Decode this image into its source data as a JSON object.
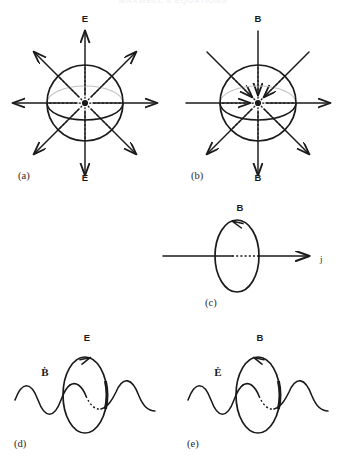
{
  "figure": {
    "title": "MAXWELL'S EQUATIONS",
    "background_color": "#ffffff",
    "ink_color": "#1a1a1a",
    "hidden_edge_color": "#b9b9bd",
    "width": 346,
    "height": 464
  },
  "panels": [
    {
      "id": "a",
      "label": "(a)",
      "label_x": 18,
      "label_y": 179,
      "kind": "sphere-radial-field",
      "center_x": 85,
      "center_y": 103,
      "radius": 38,
      "arrow_length": 72,
      "top_label": "E",
      "top_label_x": 85,
      "top_label_y": 22,
      "bottom_label": "E",
      "bottom_label_x": 85,
      "bottom_label_y": 181,
      "arrow_directions": [
        "out",
        "out",
        "out",
        "out",
        "out",
        "out",
        "out",
        "out"
      ],
      "arrow_angles": [
        90,
        45,
        0,
        -45,
        -90,
        -135,
        180,
        135
      ]
    },
    {
      "id": "b",
      "label": "(b)",
      "label_x": 191,
      "label_y": 179,
      "kind": "sphere-through-field",
      "center_x": 258,
      "center_y": 103,
      "radius": 38,
      "arrow_length": 72,
      "top_label": "B",
      "top_label_x": 258,
      "top_label_y": 22,
      "bottom_label": "B",
      "bottom_label_x": 258,
      "bottom_label_y": 181,
      "arrow_directions": [
        "in",
        "in",
        "out",
        "out",
        "out",
        "in",
        "in",
        "in"
      ],
      "arrow_angles": [
        90,
        45,
        0,
        -45,
        -90,
        -135,
        180,
        135
      ]
    },
    {
      "id": "c",
      "label": "(c)",
      "label_x": 205,
      "label_y": 306,
      "kind": "loop-around-current",
      "loop_cx": 237,
      "loop_cy": 256,
      "loop_rx": 22,
      "loop_ry": 36,
      "field_label": "B",
      "field_label_x": 240,
      "field_label_y": 211,
      "circulation": "counterclockwise",
      "axis_label": "j",
      "axis_label_x": 320,
      "axis_label_y": 262,
      "axis_y": 256,
      "axis_x_start": 163,
      "axis_x_end": 310
    },
    {
      "id": "d",
      "label": "(d)",
      "label_x": 14,
      "label_y": 447,
      "kind": "wave-through-loop",
      "loop_cx": 85,
      "loop_cy": 395,
      "loop_rx": 22,
      "loop_ry": 38,
      "field_label": "E",
      "field_label_x": 87,
      "field_label_y": 341,
      "circulation": "clockwise",
      "source_label": "Ḃ",
      "source_label_x": 45,
      "source_label_y": 376,
      "wave_y": 400,
      "wave_x_start": 15,
      "wave_x_end": 160,
      "wave_amplitude": 17,
      "wave_cycles": 1.55
    },
    {
      "id": "e",
      "label": "(e)",
      "label_x": 187,
      "label_y": 447,
      "kind": "wave-through-loop",
      "loop_cx": 258,
      "loop_cy": 395,
      "loop_rx": 22,
      "loop_ry": 38,
      "field_label": "B",
      "field_label_x": 260,
      "field_label_y": 341,
      "circulation": "counterclockwise",
      "source_label": "Ė",
      "source_label_x": 218,
      "source_label_y": 376,
      "wave_y": 400,
      "wave_x_start": 188,
      "wave_x_end": 333,
      "wave_amplitude": 17,
      "wave_cycles": 1.55
    }
  ]
}
